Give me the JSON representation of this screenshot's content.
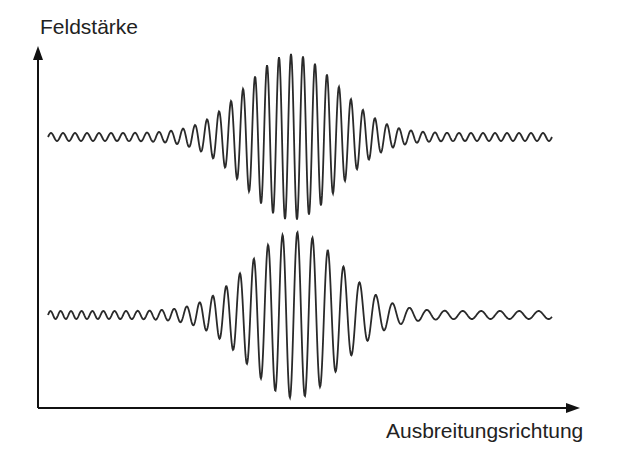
{
  "diagram": {
    "y_axis_label": "Feldstärke",
    "x_axis_label": "Ausbreitungsrichtung",
    "colors": {
      "stroke": "#2a2a2a",
      "axis": "#111111",
      "background": "#ffffff"
    }
  },
  "waves": [
    {
      "name": "wave-packet-unchirped",
      "baseline_y": 137,
      "x_start": 48,
      "x_end": 552,
      "center_x": 292,
      "amplitude": 83,
      "envelope_width": 95,
      "base_amplitude": 4,
      "period_left": 12,
      "period_right": 12
    },
    {
      "name": "wave-packet-chirped",
      "baseline_y": 315,
      "x_start": 48,
      "x_end": 552,
      "center_x": 295,
      "amplitude": 83,
      "envelope_width": 95,
      "base_amplitude": 4,
      "period_left": 10,
      "period_right": 20
    }
  ],
  "axes": {
    "origin": [
      38,
      408
    ],
    "y_top": 48,
    "x_right": 580
  }
}
